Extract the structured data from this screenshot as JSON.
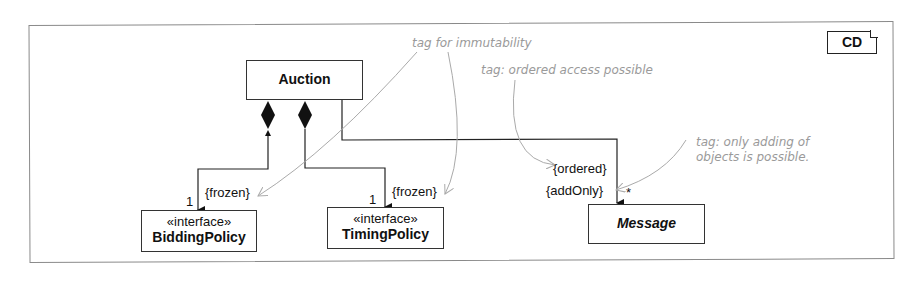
{
  "diagram": {
    "type": "UML class diagram",
    "tag": "CD",
    "classes": [
      {
        "id": "auction",
        "name": "Auction",
        "stereotype": null,
        "abstract": false
      },
      {
        "id": "bidding",
        "name": "BiddingPolicy",
        "stereotype": "«interface»",
        "abstract": false
      },
      {
        "id": "timing",
        "name": "TimingPolicy",
        "stereotype": "«interface»",
        "abstract": false
      },
      {
        "id": "message",
        "name": "Message",
        "stereotype": null,
        "abstract": true
      }
    ],
    "associations": [
      {
        "from": "auction",
        "to": "bidding",
        "kind": "composition",
        "multiplicity": "1",
        "constraint": "{frozen}"
      },
      {
        "from": "auction",
        "to": "timing",
        "kind": "composition",
        "multiplicity": "1",
        "constraint": "{frozen}"
      },
      {
        "from": "auction",
        "to": "message",
        "kind": "association",
        "multiplicity": "*",
        "constraints": [
          "{ordered}",
          "{addOnly}"
        ]
      }
    ],
    "notes": [
      {
        "text": "tag for immutability"
      },
      {
        "text": "tag: ordered access possible"
      },
      {
        "lines": [
          "tag: only adding of",
          "objects is possible."
        ]
      }
    ]
  }
}
